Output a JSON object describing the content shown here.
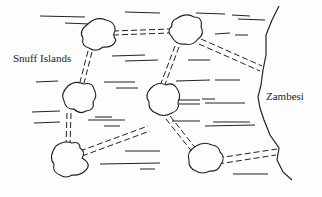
{
  "labels": {
    "islands_group": "Snuff Islands",
    "river": "Zambesi"
  },
  "islands": [
    {
      "id": "A",
      "cx": 95,
      "cy": 36
    },
    {
      "id": "B",
      "cx": 186,
      "cy": 31
    },
    {
      "id": "C",
      "cx": 80,
      "cy": 98
    },
    {
      "id": "D",
      "cx": 163,
      "cy": 100
    },
    {
      "id": "E",
      "cx": 68,
      "cy": 162
    },
    {
      "id": "F",
      "cx": 210,
      "cy": 158
    }
  ],
  "bridges": [
    {
      "from": "A",
      "to": "B"
    },
    {
      "from": "A",
      "to": "C"
    },
    {
      "from": "B",
      "to": "D"
    },
    {
      "from": "B",
      "to": "east-bank"
    },
    {
      "from": "C",
      "to": "E"
    },
    {
      "from": "E",
      "to": "D"
    },
    {
      "from": "D",
      "to": "F"
    },
    {
      "from": "F",
      "to": "east-bank"
    }
  ],
  "colors": {
    "ink": "#1a1a1a",
    "background": "#fdfdfd"
  }
}
